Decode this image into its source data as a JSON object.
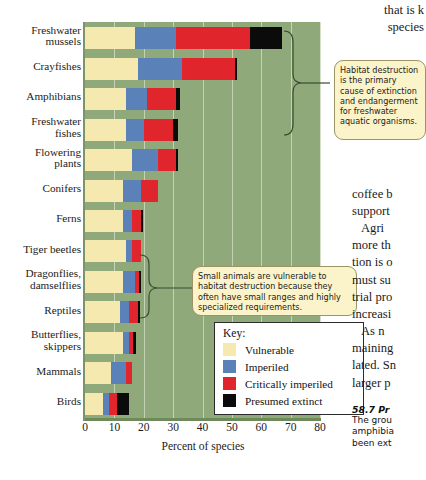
{
  "figure": {
    "xaxis_title": "Percent of species",
    "xticks": [
      "0",
      "10",
      "20",
      "30",
      "40",
      "50",
      "60",
      "70",
      "80"
    ],
    "legend": {
      "title": "Key:",
      "items": [
        {
          "label": "Vulnerable",
          "color": "#f6e9b0"
        },
        {
          "label": "Imperiled",
          "color": "#5b82b8"
        },
        {
          "label": "Critically imperiled",
          "color": "#e0262c"
        },
        {
          "label": "Presumed extinct",
          "color": "#0b0b0b"
        }
      ]
    },
    "callouts": [
      {
        "name": "habitat-destruction",
        "text": "Habitat destruction is the primary cause of extinction and endangerment for freshwater aquatic organisms."
      },
      {
        "name": "small-animals",
        "text": "Small animals are vulnerable to habitat destruction because they often have small ranges and highly specialized requirements."
      }
    ],
    "plot_background": "#8fa97b"
  },
  "chart_data": {
    "type": "bar",
    "orientation": "horizontal",
    "stacked": true,
    "title": "",
    "xlabel": "Percent of species",
    "ylabel": "",
    "xlim": [
      0,
      80
    ],
    "grid": true,
    "legend_position": "inside-lower-right",
    "categories": [
      "Freshwater mussels",
      "Crayfishes",
      "Amphibians",
      "Freshwater fishes",
      "Flowering plants",
      "Conifers",
      "Ferns",
      "Tiger beetles",
      "Dragonflies, damselflies",
      "Reptiles",
      "Butterflies, skippers",
      "Mammals",
      "Birds"
    ],
    "series": [
      {
        "name": "Vulnerable",
        "color": "#f6e9b0",
        "values": [
          17,
          18,
          14,
          14,
          16,
          13,
          13,
          14,
          13,
          12,
          13,
          9,
          6
        ]
      },
      {
        "name": "Imperiled",
        "color": "#5b82b8",
        "values": [
          14,
          15,
          7,
          6,
          9,
          6,
          3,
          2,
          4,
          3,
          2,
          5,
          2
        ]
      },
      {
        "name": "Critically imperiled",
        "color": "#e0262c",
        "values": [
          25,
          18,
          10,
          10,
          6,
          6,
          3,
          3,
          1.5,
          3,
          1.5,
          2,
          3
        ]
      },
      {
        "name": "Presumed extinct",
        "color": "#0b0b0b",
        "values": [
          11,
          0.7,
          1.5,
          1.5,
          0.7,
          0,
          0.7,
          0,
          0.7,
          0.7,
          0.7,
          0,
          4
        ]
      }
    ]
  },
  "bodytext": {
    "lines": [
      "that is k",
      "species"
    ],
    "paragraph2": [
      "coffee b",
      "support"
    ],
    "paragraph3": [
      "Agri",
      "more th",
      "tion is o",
      "must su",
      "trial pro",
      "increasi"
    ],
    "paragraph4": [
      "As n",
      "maining",
      "lated. Sn",
      "larger p"
    ]
  },
  "caption": {
    "number": "58.7  Pr",
    "lines": [
      "The grou",
      "amphibia",
      "been ext"
    ]
  }
}
